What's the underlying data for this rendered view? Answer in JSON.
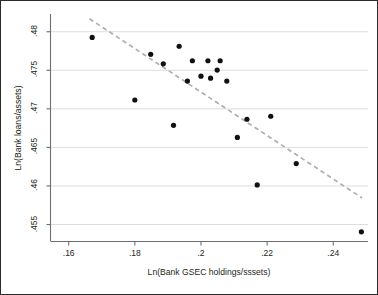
{
  "chart_data": {
    "type": "scatter",
    "title": "",
    "xlabel": "Ln(Bank GSEC holdings/sssets)",
    "ylabel": "Ln(Bank loans/assets)",
    "xlim": [
      0.1545,
      0.2505
    ],
    "ylim": [
      0.4528,
      0.4823
    ],
    "xticks": [
      0.16,
      0.18,
      0.2,
      0.22,
      0.24
    ],
    "xticklabels": [
      ".16",
      ".18",
      ".2",
      ".22",
      ".24"
    ],
    "yticks": [
      0.455,
      0.46,
      0.465,
      0.47,
      0.475,
      0.48
    ],
    "yticklabels": [
      ".455",
      ".46",
      ".465",
      ".47",
      ".475",
      ".48"
    ],
    "grid": "horizontal",
    "grid_color": "#d9d9d9",
    "legend": "none",
    "marker": {
      "shape": "circle",
      "color": "#111111",
      "size": 5.2
    },
    "points": [
      {
        "x": 0.1671,
        "y": 0.47926
      },
      {
        "x": 0.18,
        "y": 0.47115
      },
      {
        "x": 0.1848,
        "y": 0.47707
      },
      {
        "x": 0.1886,
        "y": 0.47584
      },
      {
        "x": 0.1917,
        "y": 0.46787
      },
      {
        "x": 0.1934,
        "y": 0.47812
      },
      {
        "x": 0.1959,
        "y": 0.4736
      },
      {
        "x": 0.1974,
        "y": 0.47624
      },
      {
        "x": 0.2,
        "y": 0.47424
      },
      {
        "x": 0.2021,
        "y": 0.47624
      },
      {
        "x": 0.2029,
        "y": 0.47398
      },
      {
        "x": 0.2049,
        "y": 0.47503
      },
      {
        "x": 0.2058,
        "y": 0.47624
      },
      {
        "x": 0.2078,
        "y": 0.4736
      },
      {
        "x": 0.211,
        "y": 0.4663
      },
      {
        "x": 0.2139,
        "y": 0.46865
      },
      {
        "x": 0.217,
        "y": 0.46013
      },
      {
        "x": 0.2211,
        "y": 0.46904
      },
      {
        "x": 0.2288,
        "y": 0.46291
      },
      {
        "x": 0.2485,
        "y": 0.45406
      }
    ],
    "trendline": {
      "style": "dashed",
      "color": "#b0aeae",
      "x0": 0.1663,
      "y0": 0.48168,
      "x1": 0.2487,
      "y1": 0.45845
    }
  }
}
